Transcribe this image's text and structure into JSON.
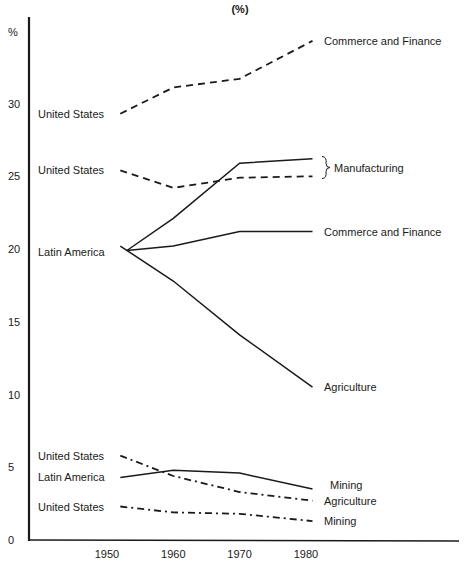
{
  "chart_data": {
    "type": "line",
    "title": "(%)",
    "xlabel": "",
    "ylabel": "%",
    "x": [
      1952,
      1960,
      1970,
      1981
    ],
    "xticks": [
      1950,
      1960,
      1970,
      1980
    ],
    "yticks": [
      0,
      5,
      10,
      15,
      20,
      25,
      30
    ],
    "ylim": [
      0,
      35
    ],
    "grid": false,
    "legend": "inline labels",
    "series": [
      {
        "name": "United States - Commerce and Finance",
        "country": "United States",
        "sector": "Commerce and Finance",
        "style": "dashed",
        "x": [
          1952,
          1960,
          1970,
          1981
        ],
        "values": [
          29.3,
          31.1,
          31.7,
          34.3
        ]
      },
      {
        "name": "United States - Manufacturing",
        "country": "United States",
        "sector": "Manufacturing",
        "style": "dashed",
        "x": [
          1952,
          1960,
          1970,
          1981
        ],
        "values": [
          25.4,
          24.2,
          24.9,
          25.0
        ]
      },
      {
        "name": "Latin America - Manufacturing",
        "country": "Latin America",
        "sector": "Manufacturing",
        "style": "solid",
        "x": [
          1953,
          1960,
          1970,
          1981
        ],
        "values": [
          19.9,
          22.1,
          25.9,
          26.2
        ]
      },
      {
        "name": "Latin America - Commerce and Finance",
        "country": "Latin America",
        "sector": "Commerce and Finance",
        "style": "solid",
        "x": [
          1953,
          1960,
          1970,
          1981
        ],
        "values": [
          19.9,
          20.2,
          21.2,
          21.2
        ]
      },
      {
        "name": "Latin America - Agriculture",
        "country": "Latin America",
        "sector": "Agriculture",
        "style": "solid",
        "x": [
          1952,
          1960,
          1970,
          1981
        ],
        "values": [
          20.2,
          17.8,
          14.1,
          10.5
        ]
      },
      {
        "name": "United States - Agriculture",
        "country": "United States",
        "sector": "Agriculture",
        "style": "dash-dot",
        "x": [
          1952,
          1960,
          1970,
          1981
        ],
        "values": [
          5.8,
          4.4,
          3.3,
          2.7
        ]
      },
      {
        "name": "Latin America - Mining",
        "country": "Latin America",
        "sector": "Mining",
        "style": "solid",
        "x": [
          1952,
          1960,
          1970,
          1981
        ],
        "values": [
          4.3,
          4.8,
          4.6,
          3.5
        ]
      },
      {
        "name": "United States - Mining",
        "country": "United States",
        "sector": "Mining",
        "style": "dash-dot",
        "x": [
          1952,
          1960,
          1970,
          1981
        ],
        "values": [
          2.3,
          1.9,
          1.8,
          1.3
        ]
      }
    ],
    "left_labels": [
      {
        "text": "United States",
        "value": 29.3
      },
      {
        "text": "United States",
        "value": 25.4
      },
      {
        "text": "Latin America",
        "value": 19.8
      },
      {
        "text": "United States",
        "value": 5.8
      },
      {
        "text": "Latin America",
        "value": 4.3
      },
      {
        "text": "United States",
        "value": 2.3
      }
    ],
    "right_labels": [
      {
        "text": "Commerce and Finance",
        "value": 34.3
      },
      {
        "text": "Manufacturing",
        "value": 25.6,
        "brace": true
      },
      {
        "text": "Commerce and Finance",
        "value": 21.2
      },
      {
        "text": "Agriculture",
        "value": 10.5
      },
      {
        "text": "Mining",
        "value": 3.8
      },
      {
        "text": "Agriculture",
        "value": 2.7
      },
      {
        "text": "Mining",
        "value": 1.3
      }
    ]
  }
}
